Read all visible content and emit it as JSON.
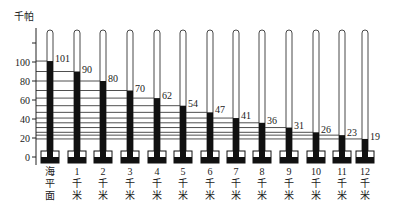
{
  "chart_data": {
    "type": "bar",
    "title": "",
    "ylabel": "千帕",
    "xlabel": "",
    "ylim": [
      0,
      120
    ],
    "yticks": [
      0,
      20,
      40,
      60,
      80,
      100
    ],
    "categories": [
      "海平面",
      "1千米",
      "2千米",
      "3千米",
      "4千米",
      "5千米",
      "6千米",
      "7千米",
      "8千米",
      "9千米",
      "10千米",
      "11千米",
      "12千米"
    ],
    "category_labels": [
      [
        "海",
        "平",
        "面"
      ],
      [
        "1",
        "千",
        "米"
      ],
      [
        "2",
        "千",
        "米"
      ],
      [
        "3",
        "千",
        "米"
      ],
      [
        "4",
        "千",
        "米"
      ],
      [
        "5",
        "千",
        "米"
      ],
      [
        "6",
        "千",
        "米"
      ],
      [
        "7",
        "千",
        "米"
      ],
      [
        "8",
        "千",
        "米"
      ],
      [
        "9",
        "千",
        "米"
      ],
      [
        "10",
        "千",
        "米"
      ],
      [
        "11",
        "千",
        "米"
      ],
      [
        "12",
        "千",
        "米"
      ]
    ],
    "values": [
      101,
      90,
      80,
      70,
      62,
      54,
      47,
      41,
      36,
      31,
      26,
      23,
      19
    ],
    "grid": false,
    "legend": null,
    "annotations": "Barometer tubes (mercury columns) showing atmospheric pressure decreasing with altitude; horizontal lines extend from each column top to the y-axis."
  },
  "colors": {
    "mercury": "#111111",
    "tube": "#333333",
    "background": "#ffffff"
  }
}
